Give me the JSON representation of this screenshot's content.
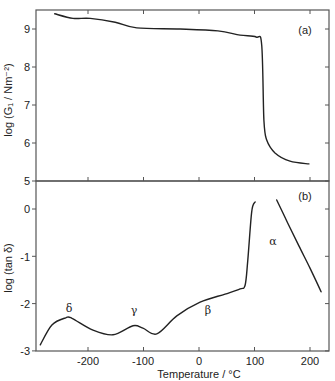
{
  "chart_data": [
    {
      "panel": "a",
      "type": "line",
      "panel_label": "(a)",
      "title": "",
      "xlabel": "Temperature / °C",
      "ylabel": "log (G₁ / Nm⁻²)",
      "xlim": [
        -295,
        234
      ],
      "ylim": [
        5,
        9.5
      ],
      "yticks": [
        5,
        6,
        7,
        8,
        9
      ],
      "xticks": [
        -200,
        -100,
        0,
        100,
        200
      ],
      "grid": false,
      "series": [
        {
          "name": "log G1",
          "x": [
            -260,
            -227,
            -196,
            -151,
            -112,
            -34,
            34,
            74,
            103,
            113,
            117,
            122,
            137,
            164,
            198
          ],
          "y": [
            9.4,
            9.28,
            9.28,
            9.18,
            9.03,
            9.0,
            8.95,
            8.84,
            8.79,
            8.58,
            6.6,
            6.08,
            5.74,
            5.52,
            5.45
          ]
        }
      ]
    },
    {
      "panel": "b",
      "type": "line",
      "panel_label": "(b)",
      "title": "",
      "xlabel": "Temperature / °C",
      "ylabel": "log (tan δ)",
      "xlim": [
        -295,
        234
      ],
      "ylim": [
        -3,
        0.6
      ],
      "yticks": [
        -3,
        -2,
        -1,
        0
      ],
      "xticks": [
        -200,
        -100,
        0,
        100,
        200
      ],
      "grid": false,
      "annotations": [
        {
          "text": "δ",
          "x": -230,
          "y": -2.15
        },
        {
          "text": "γ",
          "x": -118,
          "y": -2.2
        },
        {
          "text": "β",
          "x": 5,
          "y": -1.85
        },
        {
          "text": "α",
          "x": 158,
          "y": -0.6
        }
      ],
      "series": [
        {
          "name": "log tan δ (low-temperature branch)",
          "x": [
            -286,
            -265,
            -240,
            -229,
            -191,
            -155,
            -119,
            -101,
            -76,
            -40,
            2,
            47,
            74,
            83,
            88,
            95,
            101
          ],
          "y": [
            -2.87,
            -2.45,
            -2.3,
            -2.31,
            -2.56,
            -2.66,
            -2.47,
            -2.52,
            -2.64,
            -2.26,
            -1.97,
            -1.8,
            -1.69,
            -1.61,
            -1.08,
            -0.06,
            0.15
          ]
        },
        {
          "name": "log tan δ (α branch)",
          "x": [
            140,
            160,
            180,
            200,
            220
          ],
          "y": [
            0.19,
            -0.3,
            -0.78,
            -1.25,
            -1.75
          ]
        }
      ]
    }
  ],
  "labels": {
    "panel_a": "(a)",
    "panel_b": "(b)",
    "ylabel_top": "log (G₁ / Nm⁻²)",
    "ylabel_bottom": "log (tan δ)",
    "xlabel": "Temperature / °C",
    "peaks": {
      "delta": "δ",
      "gamma": "γ",
      "beta": "β",
      "alpha": "α"
    },
    "xticks": [
      "-200",
      "-100",
      "0",
      "100",
      "200"
    ],
    "yticks_top": [
      "9",
      "8",
      "7",
      "6",
      "5"
    ],
    "yticks_bottom": [
      "0",
      "-1",
      "-2",
      "-3"
    ]
  }
}
